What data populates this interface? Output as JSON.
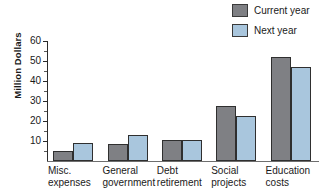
{
  "chart_data": {
    "type": "bar",
    "title": "",
    "xlabel": "",
    "ylabel": "Million Dollars",
    "ylim": [
      0,
      60
    ],
    "ytick_step": 10,
    "yticks": [
      10,
      20,
      30,
      40,
      50,
      60
    ],
    "grid": false,
    "legend_position": "top-right",
    "categories": [
      "Misc. expenses",
      "General government",
      "Debt retirement",
      "Social projects",
      "Education costs"
    ],
    "category_lines": [
      [
        "Misc.",
        "expenses"
      ],
      [
        "General",
        "government"
      ],
      [
        "Debt",
        "retirement"
      ],
      [
        "Social",
        "projects"
      ],
      [
        "Education",
        "costs"
      ]
    ],
    "series": [
      {
        "name": "Current year",
        "color": "#7f8084",
        "values": [
          5,
          8.5,
          10.5,
          27.5,
          52
        ]
      },
      {
        "name": "Next year",
        "color": "#a9c6dd",
        "values": [
          9,
          13,
          10.5,
          22.5,
          47
        ]
      }
    ]
  },
  "legend": {
    "items": [
      {
        "label": "Current year",
        "color": "#7f8084"
      },
      {
        "label": "Next year",
        "color": "#a9c6dd"
      }
    ]
  },
  "axis": {
    "y_title": "Million Dollars",
    "y_tick_labels": [
      "60",
      "50",
      "40",
      "30",
      "20",
      "10"
    ]
  }
}
